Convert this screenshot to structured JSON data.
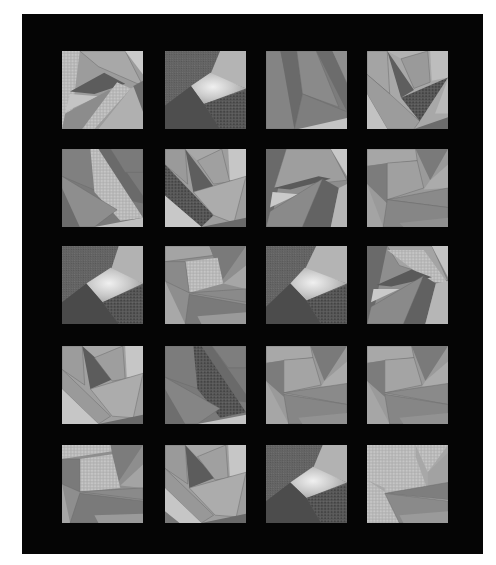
{
  "image": {
    "subject": "Grayscale crazy-patchwork quilt",
    "layout": {
      "rows": 5,
      "columns": 4,
      "background": "#050505"
    },
    "palette": {
      "black": "#050505",
      "dark_gray": "#5e5e5e",
      "mid_gray": "#7e7e7e",
      "light_gray": "#a4a4a4",
      "pale_gray": "#c2c2c2",
      "print_light": "#bdbdbd",
      "print_dark": "#4a4a4a"
    }
  }
}
